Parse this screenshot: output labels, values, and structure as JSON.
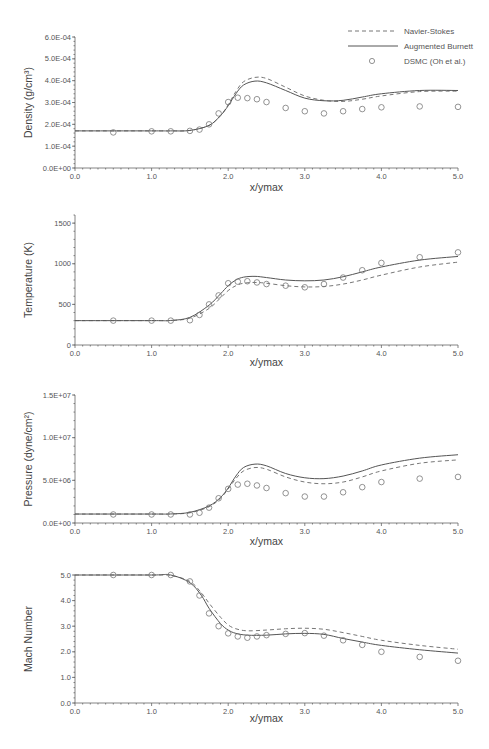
{
  "legend": {
    "items": [
      {
        "label": "Navier-Stokes",
        "style": "dashed"
      },
      {
        "label": "Augmented Burnett",
        "style": "solid"
      },
      {
        "label": "DSMC (Oh et al.)",
        "style": "circle-marker"
      }
    ]
  },
  "chart_data": [
    {
      "type": "line",
      "title": "",
      "xlabel": "x/ymax",
      "ylabel": "Density (g/cm3)",
      "ylabel_display": "Density (g/cm³)",
      "xlim": [
        0.0,
        5.0
      ],
      "ylim": [
        0.0,
        0.0006
      ],
      "xticks": [
        "0.0",
        "1.0",
        "2.0",
        "3.0",
        "4.0",
        "5.0"
      ],
      "yticks": [
        "0.0E+00",
        "1.0E-04",
        "2.0E-04",
        "3.0E-04",
        "4.0E-04",
        "5.0E-04",
        "6.0E-04"
      ],
      "ytick_values": [
        0,
        0.0001,
        0.0002,
        0.0003,
        0.0004,
        0.0005,
        0.0006
      ],
      "grid": false,
      "legend_position": "top-right",
      "series": [
        {
          "name": "Navier-Stokes",
          "style": "dashed",
          "x": [
            0.0,
            1.0,
            1.25,
            1.5,
            1.75,
            1.9,
            2.0,
            2.1,
            2.2,
            2.35,
            2.5,
            2.75,
            3.0,
            3.25,
            3.5,
            3.75,
            4.0,
            4.5,
            5.0
          ],
          "y": [
            0.00017,
            0.00017,
            0.00017,
            0.000172,
            0.000195,
            0.00024,
            0.00029,
            0.00035,
            0.000395,
            0.000415,
            0.00041,
            0.00037,
            0.00033,
            0.00031,
            0.000305,
            0.000315,
            0.00033,
            0.00035,
            0.000352
          ]
        },
        {
          "name": "Augmented Burnett",
          "style": "solid",
          "x": [
            0.0,
            1.0,
            1.25,
            1.5,
            1.75,
            1.9,
            2.0,
            2.1,
            2.2,
            2.35,
            2.5,
            2.75,
            3.0,
            3.25,
            3.5,
            3.75,
            4.0,
            4.5,
            5.0
          ],
          "y": [
            0.00017,
            0.00017,
            0.00017,
            0.000172,
            0.000195,
            0.00024,
            0.000285,
            0.00034,
            0.00038,
            0.000398,
            0.00039,
            0.000355,
            0.00032,
            0.000308,
            0.00031,
            0.000325,
            0.00034,
            0.000355,
            0.000355
          ]
        },
        {
          "name": "DSMC (Oh et al.)",
          "style": "markers",
          "x": [
            0.5,
            1.0,
            1.25,
            1.5,
            1.625,
            1.75,
            1.875,
            2.0,
            2.125,
            2.25,
            2.375,
            2.5,
            2.75,
            3.0,
            3.25,
            3.5,
            3.75,
            4.0,
            4.5,
            5.0
          ],
          "y": [
            0.000163,
            0.000168,
            0.000168,
            0.00017,
            0.000176,
            0.0002,
            0.00025,
            0.000302,
            0.000322,
            0.00032,
            0.000315,
            0.000302,
            0.000275,
            0.00026,
            0.00025,
            0.00026,
            0.00027,
            0.000278,
            0.000282,
            0.00028
          ]
        }
      ]
    },
    {
      "type": "line",
      "title": "",
      "xlabel": "x/ymax",
      "ylabel": "Temperature (K)",
      "xlim": [
        0.0,
        5.0
      ],
      "ylim": [
        0,
        1600
      ],
      "xticks": [
        "0.0",
        "1.0",
        "2.0",
        "3.0",
        "4.0",
        "5.0"
      ],
      "yticks": [
        "0",
        "500",
        "1000",
        "1500"
      ],
      "ytick_values": [
        0,
        500,
        1000,
        1500
      ],
      "grid": false,
      "series": [
        {
          "name": "Navier-Stokes",
          "style": "dashed",
          "x": [
            0.0,
            1.0,
            1.25,
            1.5,
            1.75,
            1.9,
            2.0,
            2.1,
            2.2,
            2.35,
            2.5,
            2.75,
            3.0,
            3.25,
            3.5,
            3.75,
            4.0,
            4.5,
            5.0
          ],
          "y": [
            300,
            300,
            302,
            330,
            450,
            580,
            670,
            730,
            760,
            770,
            760,
            730,
            715,
            720,
            750,
            800,
            860,
            960,
            1020
          ]
        },
        {
          "name": "Augmented Burnett",
          "style": "solid",
          "x": [
            0.0,
            1.0,
            1.25,
            1.5,
            1.75,
            1.9,
            2.0,
            2.1,
            2.2,
            2.35,
            2.5,
            2.75,
            3.0,
            3.25,
            3.5,
            3.75,
            4.0,
            4.5,
            5.0
          ],
          "y": [
            300,
            300,
            302,
            340,
            490,
            630,
            730,
            800,
            835,
            845,
            830,
            800,
            790,
            800,
            840,
            900,
            960,
            1045,
            1090
          ]
        },
        {
          "name": "DSMC (Oh et al.)",
          "style": "markers",
          "x": [
            0.5,
            1.0,
            1.25,
            1.5,
            1.625,
            1.75,
            1.875,
            2.0,
            2.125,
            2.25,
            2.375,
            2.5,
            2.75,
            3.0,
            3.25,
            3.5,
            3.75,
            4.0,
            4.5,
            5.0
          ],
          "y": [
            300,
            300,
            300,
            305,
            370,
            500,
            610,
            760,
            780,
            785,
            770,
            750,
            730,
            710,
            750,
            830,
            920,
            1010,
            1080,
            1140
          ]
        }
      ]
    },
    {
      "type": "line",
      "title": "",
      "xlabel": "x/ymax",
      "ylabel": "Pressure (dyne/cm2)",
      "ylabel_display": "Pressure (dyne/cm²)",
      "xlim": [
        0.0,
        5.0
      ],
      "ylim": [
        0,
        15000000
      ],
      "xticks": [
        "0.0",
        "1.0",
        "2.0",
        "3.0",
        "4.0",
        "5.0"
      ],
      "yticks": [
        "0.0E+00",
        "5.0E+06",
        "1.0E+07",
        "1.5E+07"
      ],
      "ytick_values": [
        0,
        5000000,
        10000000,
        15000000
      ],
      "grid": false,
      "series": [
        {
          "name": "Navier-Stokes",
          "style": "dashed",
          "x": [
            0.0,
            1.0,
            1.25,
            1.5,
            1.75,
            1.9,
            2.0,
            2.1,
            2.2,
            2.35,
            2.5,
            2.75,
            3.0,
            3.25,
            3.5,
            3.75,
            4.0,
            4.5,
            5.0
          ],
          "y": [
            1050000,
            1050000,
            1060000,
            1200000,
            1900000,
            2900000,
            4000000,
            5200000,
            6100000,
            6500000,
            6300000,
            5400000,
            4800000,
            4600000,
            4800000,
            5400000,
            6100000,
            7000000,
            7400000
          ]
        },
        {
          "name": "Augmented Burnett",
          "style": "solid",
          "x": [
            0.0,
            1.0,
            1.25,
            1.5,
            1.75,
            1.9,
            2.0,
            2.1,
            2.2,
            2.35,
            2.5,
            2.75,
            3.0,
            3.25,
            3.5,
            3.75,
            4.0,
            4.5,
            5.0
          ],
          "y": [
            1050000,
            1050000,
            1060000,
            1250000,
            2000000,
            3000000,
            4100000,
            5500000,
            6500000,
            6900000,
            6700000,
            5800000,
            5300000,
            5200000,
            5500000,
            6100000,
            6800000,
            7600000,
            8000000
          ]
        },
        {
          "name": "DSMC (Oh et al.)",
          "style": "markers",
          "x": [
            0.5,
            1.0,
            1.25,
            1.5,
            1.625,
            1.75,
            1.875,
            2.0,
            2.125,
            2.25,
            2.375,
            2.5,
            2.75,
            3.0,
            3.25,
            3.5,
            3.75,
            4.0,
            4.5,
            5.0
          ],
          "y": [
            1000000,
            1000000,
            1000000,
            1000000,
            1200000,
            1800000,
            2900000,
            4000000,
            4500000,
            4600000,
            4400000,
            4100000,
            3500000,
            3100000,
            3100000,
            3600000,
            4200000,
            4800000,
            5200000,
            5400000
          ]
        }
      ]
    },
    {
      "type": "line",
      "title": "",
      "xlabel": "x/ymax",
      "ylabel": "Mach Number",
      "xlim": [
        0.0,
        5.0
      ],
      "ylim": [
        0.0,
        5.0
      ],
      "xticks": [
        "0.0",
        "1.0",
        "2.0",
        "3.0",
        "4.0",
        "5.0"
      ],
      "yticks": [
        "0.0",
        "1.0",
        "2.0",
        "3.0",
        "4.0",
        "5.0"
      ],
      "ytick_values": [
        0,
        1,
        2,
        3,
        4,
        5
      ],
      "grid": false,
      "series": [
        {
          "name": "Navier-Stokes",
          "style": "dashed",
          "x": [
            0.0,
            1.0,
            1.25,
            1.5,
            1.65,
            1.75,
            1.9,
            2.0,
            2.1,
            2.25,
            2.5,
            2.75,
            3.0,
            3.25,
            3.5,
            3.75,
            4.0,
            4.5,
            5.0
          ],
          "y": [
            5.0,
            5.0,
            4.98,
            4.75,
            4.3,
            3.9,
            3.35,
            3.05,
            2.9,
            2.82,
            2.85,
            2.9,
            2.92,
            2.88,
            2.75,
            2.6,
            2.45,
            2.25,
            2.1
          ]
        },
        {
          "name": "Augmented Burnett",
          "style": "solid",
          "x": [
            0.0,
            1.0,
            1.25,
            1.5,
            1.65,
            1.75,
            1.9,
            2.0,
            2.1,
            2.25,
            2.5,
            2.75,
            3.0,
            3.25,
            3.5,
            3.75,
            4.0,
            4.5,
            5.0
          ],
          "y": [
            5.0,
            5.0,
            5.0,
            4.7,
            4.2,
            3.7,
            3.1,
            2.85,
            2.72,
            2.65,
            2.65,
            2.7,
            2.72,
            2.68,
            2.52,
            2.38,
            2.25,
            2.08,
            1.95
          ]
        },
        {
          "name": "DSMC (Oh et al.)",
          "style": "markers",
          "x": [
            0.5,
            1.0,
            1.25,
            1.5,
            1.625,
            1.75,
            1.875,
            2.0,
            2.125,
            2.25,
            2.375,
            2.5,
            2.75,
            3.0,
            3.25,
            3.5,
            3.75,
            4.0,
            4.5,
            5.0
          ],
          "y": [
            5.0,
            5.0,
            5.0,
            4.75,
            4.2,
            3.5,
            3.0,
            2.72,
            2.6,
            2.55,
            2.6,
            2.65,
            2.7,
            2.73,
            2.63,
            2.45,
            2.27,
            2.0,
            1.8,
            1.65
          ]
        }
      ]
    }
  ],
  "layout": {
    "panels": [
      {
        "plot_left": 75,
        "plot_right": 458,
        "y_top_px": 37,
        "y_bottom_px": 168,
        "ymin": 0,
        "ymax": 0.0006,
        "axis_top_px": 37,
        "xlabel_y": 191,
        "ylabel_x": 32
      },
      {
        "plot_left": 75,
        "plot_right": 458,
        "y_top_px": 215,
        "y_bottom_px": 345,
        "ymin": 0,
        "ymax": 1600,
        "axis_top_px": 215,
        "xlabel_y": 366,
        "ylabel_x": 32
      },
      {
        "plot_left": 75,
        "plot_right": 458,
        "y_top_px": 395,
        "y_bottom_px": 523,
        "ymin": 0,
        "ymax": 15000000,
        "axis_top_px": 395,
        "xlabel_y": 545,
        "ylabel_x": 32
      },
      {
        "plot_left": 75,
        "plot_right": 458,
        "y_top_px": 575,
        "y_bottom_px": 703,
        "ymin": 0,
        "ymax": 5,
        "axis_top_px": 575,
        "xlabel_y": 722,
        "ylabel_x": 32
      }
    ]
  }
}
